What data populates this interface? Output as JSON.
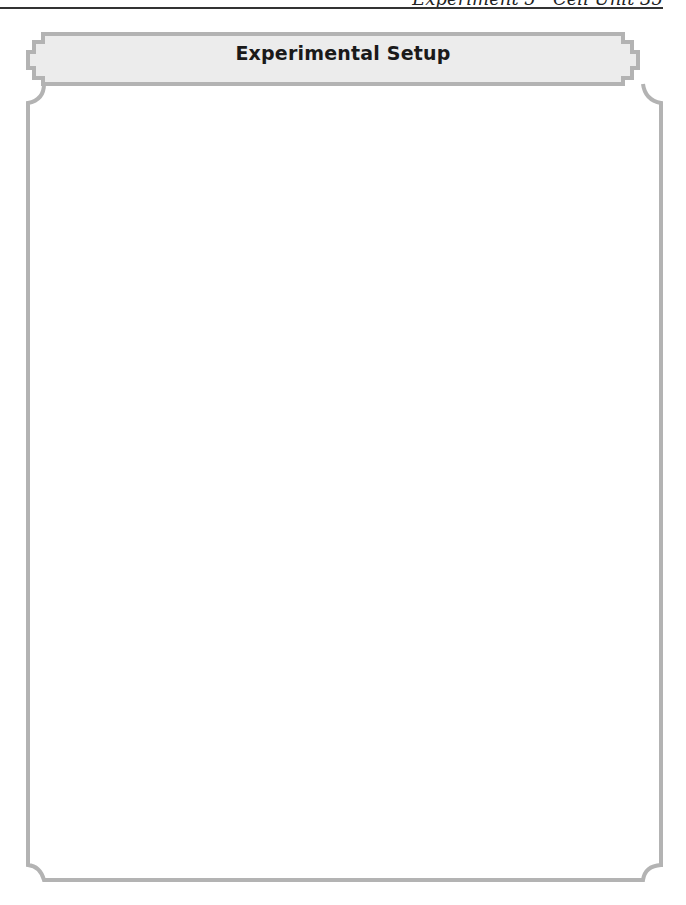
{
  "page": {
    "running_head": "Experiment 5 · Cell Unit   35"
  },
  "box": {
    "title": "Experimental Setup",
    "content": ""
  },
  "colors": {
    "frame": "#b3b3b3",
    "header_fill": "#ececec",
    "rule": "#333333"
  }
}
